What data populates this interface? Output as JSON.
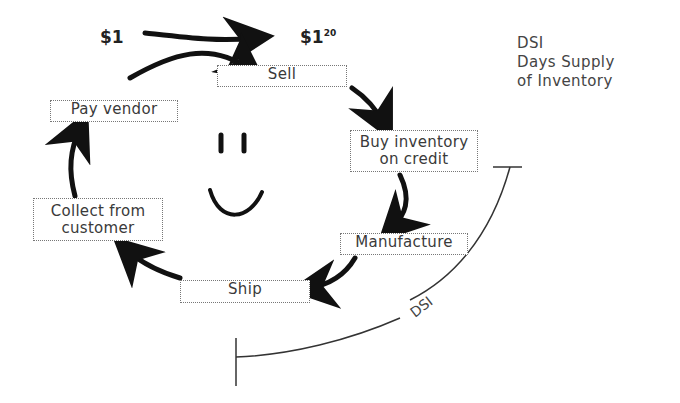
{
  "money": {
    "start": "$1",
    "end_base": "$1",
    "end_sup": "20"
  },
  "legend": {
    "abbr": "DSI",
    "line1": "Days Supply",
    "line2": "of Inventory"
  },
  "steps": [
    {
      "label": "Sell"
    },
    {
      "label": "Buy inventory on credit"
    },
    {
      "label": "Manufacture"
    },
    {
      "label": "Ship"
    },
    {
      "label": "Collect from customer"
    },
    {
      "label": "Pay vendor"
    }
  ],
  "dsi_arc": {
    "label": "DSI"
  },
  "colors": {
    "ink": "#111111",
    "box_border": "#777777",
    "text": "#3a3a3a"
  }
}
